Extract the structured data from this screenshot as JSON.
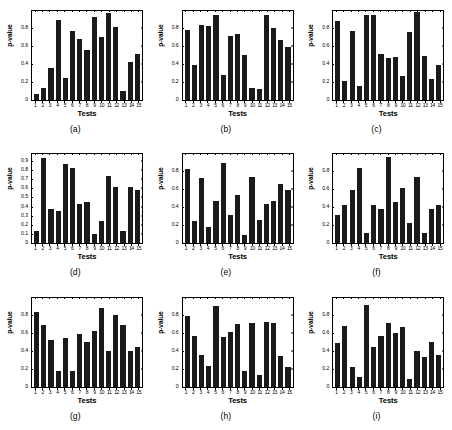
{
  "figure": {
    "title": "",
    "rows": 3,
    "cols": 3
  },
  "chart_data": [
    {
      "type": "bar",
      "panel": "a",
      "caption": "(a)",
      "title": "",
      "xlabel": "Tests",
      "ylabel": "p-value",
      "categories": [
        "1",
        "2",
        "3",
        "4",
        "5",
        "6",
        "7",
        "8",
        "9",
        "10",
        "11",
        "12",
        "13",
        "14",
        "15"
      ],
      "values": [
        0.07,
        0.13,
        0.36,
        0.9,
        0.25,
        0.77,
        0.68,
        0.56,
        0.93,
        0.71,
        0.98,
        0.82,
        0.1,
        0.43,
        0.52
      ],
      "ylim": [
        0,
        1.0
      ],
      "yticks": [
        0.2,
        0.4,
        0.6,
        0.8
      ],
      "ytick_labels": [
        "0.2",
        "0.4",
        "0.6",
        "0.8"
      ],
      "grid": false,
      "legend": null,
      "bar_color": "#1a1a1a"
    },
    {
      "type": "bar",
      "panel": "b",
      "caption": "(b)",
      "title": "",
      "xlabel": "Tests",
      "ylabel": "p-value",
      "categories": [
        "1",
        "2",
        "3",
        "4",
        "5",
        "6",
        "7",
        "8",
        "9",
        "10",
        "11",
        "12",
        "13",
        "14",
        "15"
      ],
      "values": [
        0.79,
        0.39,
        0.84,
        0.83,
        0.95,
        0.28,
        0.72,
        0.74,
        0.51,
        0.13,
        0.12,
        0.95,
        0.81,
        0.67,
        0.6
      ],
      "ylim": [
        0,
        1.0
      ],
      "yticks": [
        0.2,
        0.4,
        0.6,
        0.8
      ],
      "ytick_labels": [
        "0.2",
        "0.4",
        "0.6",
        "0.8"
      ],
      "grid": false,
      "legend": null,
      "bar_color": "#1a1a1a"
    },
    {
      "type": "bar",
      "panel": "c",
      "caption": "(c)",
      "title": "",
      "xlabel": "Tests",
      "ylabel": "p-value",
      "categories": [
        "1",
        "2",
        "3",
        "4",
        "5",
        "6",
        "7",
        "8",
        "9",
        "10",
        "11",
        "12",
        "13",
        "14",
        "15"
      ],
      "values": [
        0.89,
        0.21,
        0.77,
        0.16,
        0.95,
        0.95,
        0.52,
        0.47,
        0.48,
        0.27,
        0.76,
        0.99,
        0.5,
        0.24,
        0.39
      ],
      "ylim": [
        0,
        1.0
      ],
      "yticks": [
        0.2,
        0.4,
        0.6,
        0.8
      ],
      "ytick_labels": [
        "0.2",
        "0.4",
        "0.6",
        "0.8"
      ],
      "grid": false,
      "legend": null,
      "bar_color": "#1a1a1a"
    },
    {
      "type": "bar",
      "panel": "d",
      "caption": "(d)",
      "title": "",
      "xlabel": "Tests",
      "ylabel": "p-value",
      "categories": [
        "1",
        "2",
        "3",
        "4",
        "5",
        "6",
        "7",
        "8",
        "9",
        "10",
        "11",
        "12",
        "13",
        "14",
        "15"
      ],
      "values": [
        0.14,
        0.94,
        0.38,
        0.36,
        0.87,
        0.83,
        0.43,
        0.46,
        0.1,
        0.25,
        0.74,
        0.62,
        0.14,
        0.62,
        0.59
      ],
      "ylim": [
        0,
        0.98
      ],
      "yticks": [
        0.1,
        0.2,
        0.3,
        0.4,
        0.5,
        0.6,
        0.7,
        0.8,
        0.9
      ],
      "ytick_labels": [
        "0.1",
        "0.2",
        "0.3",
        "0.4",
        "0.5",
        "0.6",
        "0.7",
        "0.8",
        "0.9"
      ],
      "grid": false,
      "legend": null,
      "bar_color": "#1a1a1a"
    },
    {
      "type": "bar",
      "panel": "e",
      "caption": "(e)",
      "title": "",
      "xlabel": "Tests",
      "ylabel": "p-value",
      "categories": [
        "1",
        "2",
        "3",
        "4",
        "5",
        "6",
        "7",
        "8",
        "9",
        "10",
        "11",
        "12",
        "13",
        "14",
        "15"
      ],
      "values": [
        0.83,
        0.25,
        0.73,
        0.18,
        0.47,
        0.9,
        0.32,
        0.54,
        0.09,
        0.74,
        0.26,
        0.44,
        0.47,
        0.67,
        0.6
      ],
      "ylim": [
        0,
        1.0
      ],
      "yticks": [
        0.2,
        0.4,
        0.6,
        0.8
      ],
      "ytick_labels": [
        "0.2",
        "0.4",
        "0.6",
        "0.8"
      ],
      "grid": false,
      "legend": null,
      "bar_color": "#1a1a1a"
    },
    {
      "type": "bar",
      "panel": "f",
      "caption": "(f)",
      "title": "",
      "xlabel": "Tests",
      "ylabel": "p-value",
      "categories": [
        "1",
        "2",
        "3",
        "4",
        "5",
        "6",
        "7",
        "8",
        "9",
        "10",
        "11",
        "12",
        "13",
        "14",
        "15"
      ],
      "values": [
        0.32,
        0.43,
        0.6,
        0.85,
        0.12,
        0.43,
        0.38,
        0.97,
        0.46,
        0.62,
        0.23,
        0.74,
        0.12,
        0.39,
        0.43
      ],
      "ylim": [
        0,
        1.0
      ],
      "yticks": [
        0.2,
        0.4,
        0.6,
        0.8
      ],
      "ytick_labels": [
        "0.2",
        "0.4",
        "0.6",
        "0.8"
      ],
      "grid": false,
      "legend": null,
      "bar_color": "#1a1a1a"
    },
    {
      "type": "bar",
      "panel": "g",
      "caption": "(g)",
      "title": "",
      "xlabel": "Tests",
      "ylabel": "p-value",
      "categories": [
        "1",
        "2",
        "3",
        "4",
        "5",
        "6",
        "7",
        "8",
        "9",
        "10",
        "11",
        "12",
        "13",
        "14",
        "15"
      ],
      "values": [
        0.84,
        0.69,
        0.52,
        0.17,
        0.55,
        0.17,
        0.59,
        0.5,
        0.63,
        0.88,
        0.4,
        0.81,
        0.69,
        0.4,
        0.45
      ],
      "ylim": [
        0,
        1.0
      ],
      "yticks": [
        0.2,
        0.4,
        0.6,
        0.8
      ],
      "ytick_labels": [
        "0.2",
        "0.4",
        "0.6",
        "0.8"
      ],
      "grid": false,
      "legend": null,
      "bar_color": "#1a1a1a"
    },
    {
      "type": "bar",
      "panel": "h",
      "caption": "(h)",
      "title": "",
      "xlabel": "Tests",
      "ylabel": "p-value",
      "categories": [
        "1",
        "2",
        "3",
        "4",
        "5",
        "6",
        "7",
        "8",
        "9",
        "10",
        "11",
        "12",
        "13",
        "14",
        "15"
      ],
      "values": [
        0.79,
        0.57,
        0.35,
        0.23,
        0.91,
        0.56,
        0.61,
        0.7,
        0.18,
        0.72,
        0.13,
        0.73,
        0.72,
        0.34,
        0.22
      ],
      "ylim": [
        0,
        1.0
      ],
      "yticks": [
        0.2,
        0.4,
        0.6,
        0.8
      ],
      "ytick_labels": [
        "0.2",
        "0.4",
        "0.6",
        "0.8"
      ],
      "grid": false,
      "legend": null,
      "bar_color": "#1a1a1a"
    },
    {
      "type": "bar",
      "panel": "i",
      "caption": "(i)",
      "title": "",
      "xlabel": "Tests",
      "ylabel": "p-value",
      "categories": [
        "1",
        "2",
        "3",
        "4",
        "5",
        "6",
        "7",
        "8",
        "9",
        "10",
        "11",
        "12",
        "13",
        "14",
        "15"
      ],
      "values": [
        0.49,
        0.68,
        0.22,
        0.11,
        0.92,
        0.45,
        0.57,
        0.72,
        0.6,
        0.67,
        0.09,
        0.4,
        0.33,
        0.5,
        0.35
      ],
      "ylim": [
        0,
        1.0
      ],
      "yticks": [
        0.2,
        0.4,
        0.6,
        0.8
      ],
      "ytick_labels": [
        "0.2",
        "0.4",
        "0.6",
        "0.8"
      ],
      "grid": false,
      "legend": null,
      "bar_color": "#1a1a1a"
    }
  ]
}
